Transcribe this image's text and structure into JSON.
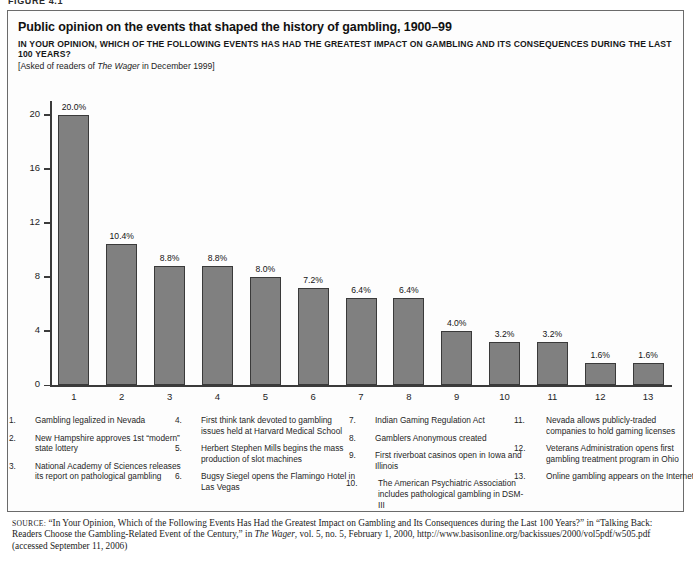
{
  "figure_label": "FIGURE 4.1",
  "title": "Public opinion on the events that shaped the history of gambling, 1900–99",
  "subtitle": "IN YOUR OPINION, WHICH OF THE FOLLOWING EVENTS HAS HAD THE GREATEST IMPACT ON GAMBLING AND ITS CONSEQUENCES DURING THE LAST 100 YEARS?",
  "asked_prefix": "[Asked of readers of ",
  "asked_italic": "The Wager",
  "asked_suffix": " in December 1999]",
  "colors": {
    "bar_fill": "#808080",
    "bar_border": "#3a3a3a",
    "axis": "#3b3b3b",
    "frame": "#6b6b6b",
    "text": "#1a1a1a"
  },
  "chart_data": {
    "type": "bar",
    "title": "Public opinion on the events that shaped the history of gambling, 1900–99",
    "xlabel": "",
    "ylabel": "",
    "ylim": [
      0,
      21
    ],
    "yticks": [
      0,
      4,
      8,
      12,
      16,
      20
    ],
    "ytick_labels": [
      "0",
      "4",
      "8",
      "12",
      "16",
      "20"
    ],
    "grid": false,
    "legend_position": "below-chart",
    "categories": [
      "1",
      "2",
      "3",
      "4",
      "5",
      "6",
      "7",
      "8",
      "9",
      "10",
      "11",
      "12",
      "13"
    ],
    "values": [
      20.0,
      10.4,
      8.8,
      8.8,
      8.0,
      7.2,
      6.4,
      6.4,
      4.0,
      3.2,
      3.2,
      1.6,
      1.6
    ],
    "data_labels": [
      "20.0%",
      "10.4%",
      "8.8%",
      "8.8%",
      "8.0%",
      "7.2%",
      "6.4%",
      "6.4%",
      "4.0%",
      "3.2%",
      "3.2%",
      "1.6%",
      "1.6%"
    ]
  },
  "legend": {
    "columns": [
      [
        {
          "num": "1.",
          "text": "Gambling legalized in Nevada"
        },
        {
          "num": "2.",
          "text": "New Hampshire approves 1st “modern” state lottery"
        },
        {
          "num": "3.",
          "text": "National Academy of Sciences releases its report on pathological gambling"
        }
      ],
      [
        {
          "num": "4.",
          "text": "First think tank devoted to gambling issues held at Harvard Medical School"
        },
        {
          "num": "5.",
          "text": "Herbert Stephen Mills begins the mass production of slot machines"
        },
        {
          "num": "6.",
          "text": "Bugsy Siegel opens the Flamingo Hotel in Las Vegas"
        }
      ],
      [
        {
          "num": "7.",
          "text": "Indian Gaming Regulation Act"
        },
        {
          "num": "8.",
          "text": "Gamblers Anonymous created"
        },
        {
          "num": "9.",
          "text": "First riverboat casinos open in Iowa and Illinois"
        },
        {
          "num": "10.",
          "text": "The American Psychiatric Association includes pathological gambling in DSM-III"
        }
      ],
      [
        {
          "num": "11.",
          "text": "Nevada allows publicly-traded companies to hold gaming licenses"
        },
        {
          "num": "12.",
          "text": "Veterans Administration opens first gambling treatment program in Ohio"
        },
        {
          "num": "13.",
          "text": "Online gambling appears on the Internet"
        }
      ]
    ]
  },
  "source": {
    "label": "SOURCE:",
    "part1": " “In Your Opinion, Which of the Following Events Has Had the Greatest Impact on Gambling and Its Consequences during the Last 100 Years?” in “Talking Back: Readers Choose the Gambling-Related Event of the Century,” in ",
    "italic": "The Wager",
    "part2": ", vol. 5, no. 5, February 1, 2000, http://www.basisonline.org/backissues/2000/vol5pdf/w505.pdf (accessed September 11, 2006)"
  }
}
